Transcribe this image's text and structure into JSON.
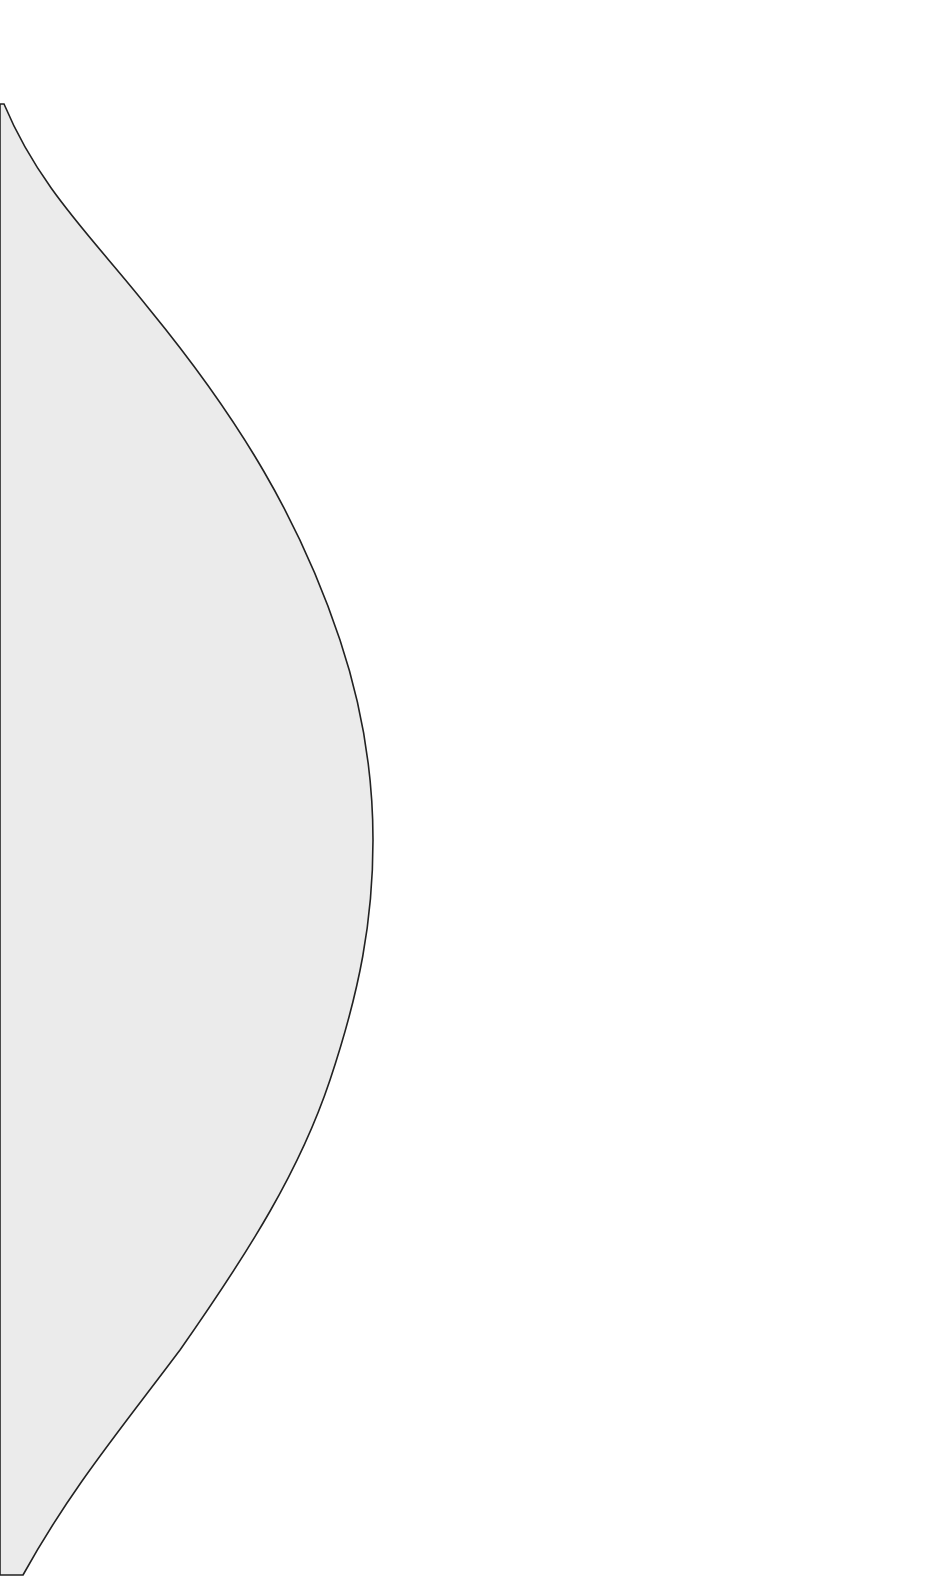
{
  "canvas": {
    "width": 939,
    "height": 1581,
    "background": "#ffffff"
  },
  "shape": {
    "fill": "#ebebeb",
    "stroke": "#222222",
    "stroke_width": 1.6,
    "path": "M 4 104 C 40 190, 95 240, 150 310 C 240 420, 300 520, 340 640 C 365 715, 373 780, 373 840 C 373 920, 360 990, 330 1080 C 300 1170, 250 1250, 180 1350 C 120 1430, 70 1490, 23 1575 L 0 1575 L 0 104 Z"
  }
}
